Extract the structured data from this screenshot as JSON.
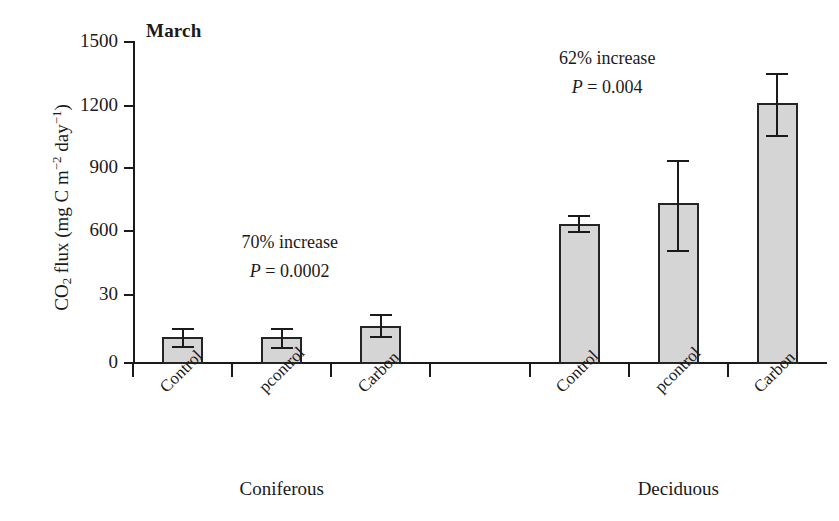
{
  "chart_data": {
    "type": "bar",
    "title": "March",
    "xlabel": "",
    "ylabel": "CO2 flux (mg C m-2 day-1)",
    "ylabel_parts": {
      "prefix": "CO",
      "sub1": "2",
      "mid": " flux (mg C m",
      "sup1": "−2",
      "mid2": " day",
      "sup2": "−1",
      "suffix": ")"
    },
    "ylim": [
      0,
      1500
    ],
    "yticks": [
      0,
      30,
      600,
      900,
      1200,
      1500
    ],
    "ytick_labels": [
      "0",
      "30",
      "600",
      "900",
      "1200",
      "1500"
    ],
    "grid": false,
    "legend": "none",
    "categories": [
      "Control",
      "pcontrol",
      "Carbon",
      "Control",
      "pcontrol",
      "Carbon"
    ],
    "groups": [
      {
        "name": "Coniferous",
        "categories": [
          "Control",
          "pcontrol",
          "Carbon"
        ]
      },
      {
        "name": "Deciduous",
        "categories": [
          "Control",
          "pcontrol",
          "Carbon"
        ]
      }
    ],
    "values": [
      120,
      120,
      175,
      650,
      750,
      1215
    ],
    "errors_low": [
      40,
      45,
      50,
      35,
      220,
      150
    ],
    "errors_high": [
      45,
      45,
      55,
      40,
      200,
      140
    ],
    "bars": [
      {
        "group": "Coniferous",
        "category": "Control",
        "value": 120,
        "err_low": 40,
        "err_high": 45
      },
      {
        "group": "Coniferous",
        "category": "pcontrol",
        "value": 120,
        "err_low": 45,
        "err_high": 45
      },
      {
        "group": "Coniferous",
        "category": "Carbon",
        "value": 175,
        "err_low": 50,
        "err_high": 55
      },
      {
        "group": "Deciduous",
        "category": "Control",
        "value": 650,
        "err_low": 35,
        "err_high": 40
      },
      {
        "group": "Deciduous",
        "category": "pcontrol",
        "value": 750,
        "err_low": 220,
        "err_high": 200
      },
      {
        "group": "Deciduous",
        "category": "Carbon",
        "value": 1215,
        "err_low": 150,
        "err_high": 140
      }
    ],
    "annotations": [
      {
        "group": "Coniferous",
        "increase": "70% increase",
        "p_symbol": "P",
        "p_text": " = 0.0002"
      },
      {
        "group": "Deciduous",
        "increase": "62% increase",
        "p_symbol": "P",
        "p_text": " = 0.004"
      }
    ],
    "colors": {
      "bar_fill": "#d5d5d5",
      "bar_border": "#242424",
      "axis": "#1a1a1a",
      "text": "#1a1a1a",
      "background": "#ffffff"
    }
  }
}
